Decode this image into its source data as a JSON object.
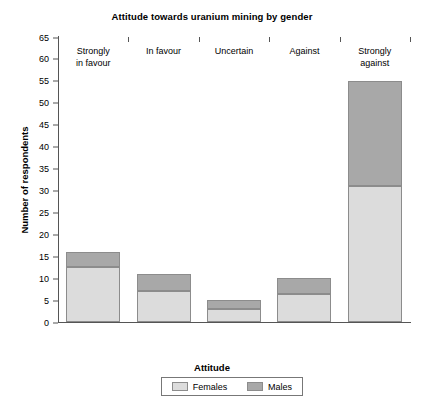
{
  "chart_data": {
    "type": "bar",
    "title": "Attitude towards uranium mining by gender",
    "xlabel": "Attitude",
    "ylabel": "Number of respondents",
    "categories": [
      "Strongly in favour",
      "In favour",
      "Uncertain",
      "Against",
      "Strongly against"
    ],
    "category_lines": [
      [
        "Strongly",
        "in favour"
      ],
      [
        "In favour"
      ],
      [
        "Uncertain"
      ],
      [
        "Against"
      ],
      [
        "Strongly",
        "against"
      ]
    ],
    "stacked": true,
    "series": [
      {
        "name": "Females",
        "color": "#dcdcdc",
        "values": [
          12.5,
          7,
          3,
          6.5,
          31
        ]
      },
      {
        "name": "Males",
        "color": "#a8a8a8",
        "values": [
          3.5,
          4,
          2,
          3.5,
          24
        ]
      }
    ],
    "totals": [
      16,
      11,
      5,
      10,
      55
    ],
    "ylim": [
      0,
      65
    ],
    "ytick_step": 5,
    "yticks": [
      0,
      5,
      10,
      15,
      20,
      25,
      30,
      35,
      40,
      45,
      50,
      55,
      60,
      65
    ],
    "grid": false,
    "legend_position": "bottom",
    "legend_entries": [
      "Females",
      "Males"
    ]
  }
}
